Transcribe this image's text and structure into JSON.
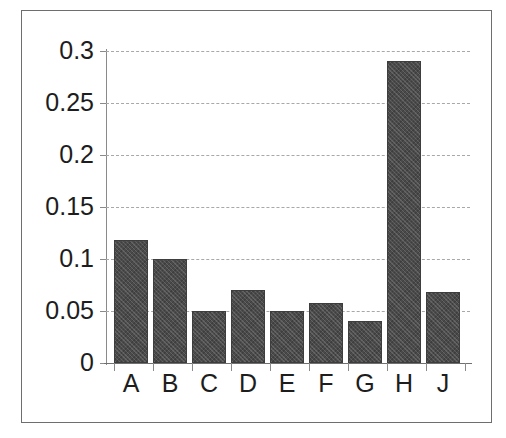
{
  "chart_data": {
    "type": "bar",
    "title": "",
    "subtitle": "",
    "xlabel": "",
    "ylabel": "",
    "categories": [
      "A",
      "B",
      "C",
      "D",
      "E",
      "F",
      "G",
      "H",
      "J"
    ],
    "values": [
      0.118,
      0.1,
      0.05,
      0.07,
      0.05,
      0.058,
      0.04,
      0.29,
      0.068
    ],
    "series": [
      {
        "name": "",
        "values": [
          0.118,
          0.1,
          0.05,
          0.07,
          0.05,
          0.058,
          0.04,
          0.29,
          0.068
        ]
      }
    ],
    "ylim": [
      0,
      0.3
    ],
    "yticks": [
      0,
      0.05,
      0.1,
      0.15,
      0.2,
      0.25,
      0.3
    ],
    "ytick_labels": [
      "0",
      "0.05",
      "0.1",
      "0.15",
      "0.2",
      "0.25",
      "0.3"
    ],
    "grid": true,
    "grid_axis": "y",
    "grid_style": "dashed",
    "legend": false,
    "legend_position": "none",
    "bar_color": "#4a4a4a",
    "gridline_color": "#a8a8a8",
    "axis_color": "#8a8a8a",
    "text_color": "#1d1d1d",
    "background_color": "#ffffff",
    "frame_color": "#6e6e6e",
    "annotations": []
  }
}
